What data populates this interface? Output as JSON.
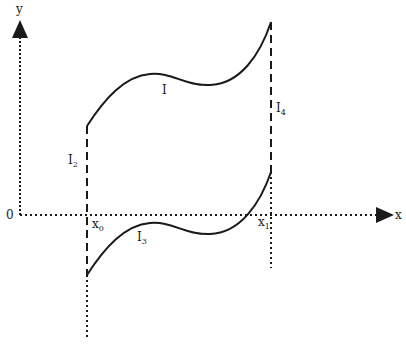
{
  "diagram": {
    "axes": {
      "x_label": "x",
      "y_label": "y",
      "origin_label": "0"
    },
    "points": {
      "x0": {
        "base": "x",
        "sub": "0"
      },
      "x1": {
        "base": "x",
        "sub": "1"
      }
    },
    "curves": {
      "upper": {
        "label": "I",
        "sub": ""
      },
      "lower": {
        "label": "I",
        "sub": "3"
      }
    },
    "segments": {
      "left": {
        "label": "I",
        "sub": "2"
      },
      "right": {
        "label": "I",
        "sub": "4"
      }
    },
    "colors": {
      "stroke": "#1a1a1a",
      "background": "#ffffff"
    }
  }
}
